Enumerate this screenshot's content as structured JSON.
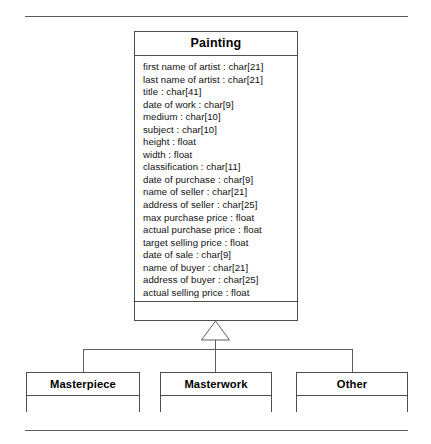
{
  "diagram": {
    "type": "uml-class-diagram",
    "notation": "generalization",
    "rules": {
      "top_label": "top-divider-rule",
      "bottom_label": "bottom-divider-rule"
    },
    "superclass": {
      "name": "Painting",
      "attributes": [
        "first name of artist : char[21]",
        "last name of artist : char[21]",
        "title : char[41]",
        "date of work : char[9]",
        "medium : char[10]",
        "subject : char[10]",
        "height : float",
        "width : float",
        "classification : char[11]",
        "date of purchase : char[9]",
        "name of seller : char[21]",
        "address of seller : char[25]",
        "max purchase price : float",
        "actual purchase price : float",
        "target selling price : float",
        "date of sale : char[9]",
        "name of buyer : char[21]",
        "address of buyer : char[25]",
        "actual selling price : float"
      ],
      "operations": []
    },
    "subclasses": [
      {
        "name": "Masterpiece",
        "attributes": [],
        "operations": []
      },
      {
        "name": "Masterwork",
        "attributes": [],
        "operations": []
      },
      {
        "name": "Other",
        "attributes": [],
        "operations": []
      }
    ],
    "colors": {
      "stroke": "#4e4e4e",
      "connector": "#5d5d5d",
      "background": "#ffffff",
      "text": "#111111"
    }
  }
}
